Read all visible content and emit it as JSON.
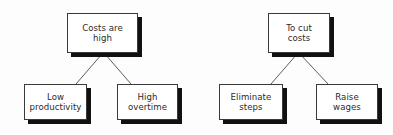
{
  "diagram": {
    "type": "tree-diagram",
    "background_color": "#fdfdfd",
    "box_fill_color": "#ffffff",
    "box_border_color": "#3a3a3a",
    "shadow_color": "#111111",
    "text_color": "#2b2b2b",
    "connector_color": "#4a4a4a",
    "trees": [
      {
        "id": "costs-are-high-tree",
        "root": {
          "id": "node-costs-are-high",
          "label": "Costs are\nhigh",
          "x": 67,
          "y": 13,
          "width": 71,
          "height": 40
        },
        "children": [
          {
            "id": "node-low-productivity",
            "label": "Low\nproductivity",
            "x": 24,
            "y": 84,
            "width": 63,
            "height": 36
          },
          {
            "id": "node-high-overtime",
            "label": "High\novertime",
            "x": 117,
            "y": 84,
            "width": 61,
            "height": 36
          }
        ]
      },
      {
        "id": "to-cut-costs-tree",
        "root": {
          "id": "node-to-cut-costs",
          "label": "To cut\ncosts",
          "x": 268,
          "y": 13,
          "width": 62,
          "height": 40
        },
        "children": [
          {
            "id": "node-eliminate-steps",
            "label": "Eliminate\nsteps",
            "x": 219,
            "y": 84,
            "width": 64,
            "height": 36
          },
          {
            "id": "node-raise-wages",
            "label": "Raise\nwages",
            "x": 316,
            "y": 84,
            "width": 62,
            "height": 36
          }
        ]
      }
    ],
    "connectors": [
      {
        "id": "connector-costs-to-low-productivity",
        "x1": 102,
        "y1": 54,
        "x2": 76,
        "y2": 84
      },
      {
        "id": "connector-costs-to-high-overtime",
        "x1": 105,
        "y1": 54,
        "x2": 131,
        "y2": 84
      },
      {
        "id": "connector-cut-to-eliminate-steps",
        "x1": 297,
        "y1": 54,
        "x2": 271,
        "y2": 84
      },
      {
        "id": "connector-cut-to-raise-wages",
        "x1": 300,
        "y1": 54,
        "x2": 328,
        "y2": 84
      }
    ]
  }
}
